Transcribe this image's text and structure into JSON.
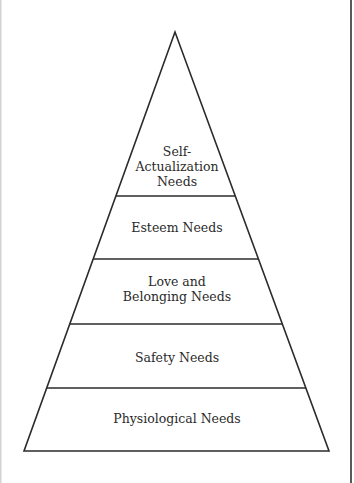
{
  "diagram": {
    "type": "pyramid",
    "levels": [
      {
        "lines": [
          "Self-",
          "Actualization",
          "Needs"
        ]
      },
      {
        "lines": [
          "Esteem Needs"
        ]
      },
      {
        "lines": [
          "Love and",
          "Belonging Needs"
        ]
      },
      {
        "lines": [
          "Safety Needs"
        ]
      },
      {
        "lines": [
          "Physiological Needs"
        ]
      }
    ],
    "stroke_color": "#2b2b2b",
    "background_color": "#ffffff"
  }
}
